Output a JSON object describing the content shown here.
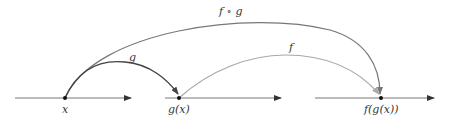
{
  "diagram": {
    "colors": {
      "axis": "#666666",
      "point": "#111111",
      "g_curve": "#444444",
      "f_curve": "#a8a8a8",
      "fog_curve": "#777777"
    },
    "axes": [
      {
        "name": "domain-of-g",
        "x1": 15,
        "x2": 132,
        "y": 98
      },
      {
        "name": "domain-of-f",
        "x1": 165,
        "x2": 282,
        "y": 98
      },
      {
        "name": "codomain-of-f",
        "x1": 315,
        "x2": 435,
        "y": 98
      }
    ],
    "points": [
      {
        "label": "x",
        "cx": 65,
        "cy": 98
      },
      {
        "label": "g(x)",
        "cx": 179,
        "cy": 98
      },
      {
        "label": "f(g(x))",
        "cx": 381,
        "cy": 98
      }
    ],
    "maps": [
      {
        "label": "g",
        "from": "x",
        "to": "g(x)"
      },
      {
        "label": "f",
        "from": "g(x)",
        "to": "f(g(x))"
      },
      {
        "label": "f ∘ g",
        "from": "x",
        "to": "f(g(x))"
      }
    ]
  }
}
